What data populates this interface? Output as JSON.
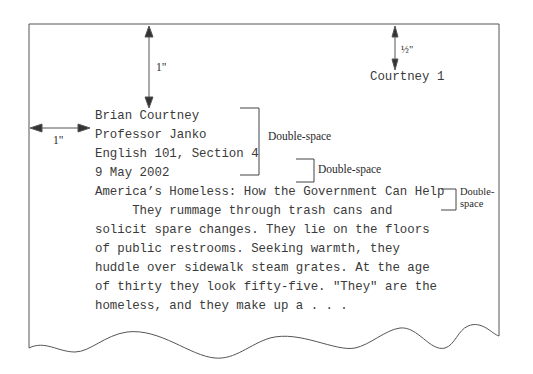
{
  "header": {
    "page_header": "Courtney 1"
  },
  "heading_block": {
    "lines": [
      "Brian Courtney",
      "Professor Janko",
      "English 101, Section 4",
      "9 May 2002"
    ]
  },
  "title": "America’s Homeless: How the Government Can Help",
  "body": {
    "lines": [
      "     They rummage through trash cans and",
      "solicit spare changes. They lie on the floors",
      "of public restrooms. Seeking warmth, they",
      "huddle over sidewalk steam grates. At the age",
      "of thirty they look fifty-five. \"They\" are the",
      "homeless, and they make up a . . ."
    ]
  },
  "annotations": {
    "top_margin": "1\"",
    "left_margin": "1\"",
    "header_margin": "½\"",
    "double_space_heading": "Double-space",
    "double_space_title": "Double-space",
    "double_space_body_line1": "Double-",
    "double_space_body_line2": "space"
  },
  "colors": {
    "page_border": "#555555",
    "arrow": "#333333",
    "bracket": "#444444",
    "text": "#3a3a3a"
  }
}
